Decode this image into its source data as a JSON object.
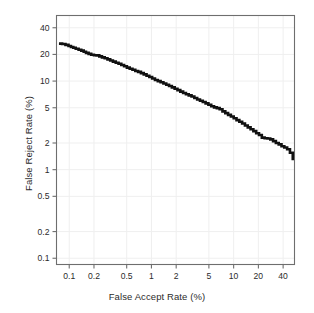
{
  "figure": {
    "background_color": "#ffffff",
    "frame_color": "#6e6e6e",
    "grid_color": "#efefef",
    "curve_color": "#111111",
    "text_color": "#2b2b2b"
  },
  "chart_data": {
    "type": "line",
    "title": "",
    "subtitle": "",
    "xlabel": "False Accept Rate (%)",
    "ylabel": "False Reject Rate (%)",
    "xscale": "log",
    "yscale": "log",
    "xlim": [
      0.07,
      55
    ],
    "ylim": [
      0.085,
      55
    ],
    "grid": true,
    "legend": null,
    "xticks": [
      0.1,
      0.2,
      0.5,
      1,
      2,
      5,
      10,
      20,
      40
    ],
    "xticklabels": [
      "0.1",
      "0.2",
      "0.5",
      "1",
      "2",
      "5",
      "10",
      "20",
      "40"
    ],
    "yticks": [
      0.1,
      0.2,
      0.5,
      1,
      2,
      5,
      10,
      20,
      40
    ],
    "yticklabels": [
      "0.1",
      "0.2",
      "0.5",
      "1",
      "2",
      "5",
      "10",
      "20",
      "40"
    ],
    "series": [
      {
        "name": "DET curve",
        "color": "#111111",
        "linewidth": 2.6,
        "x": [
          0.075,
          0.082,
          0.09,
          0.098,
          0.105,
          0.112,
          0.12,
          0.13,
          0.14,
          0.15,
          0.16,
          0.172,
          0.185,
          0.2,
          0.215,
          0.232,
          0.25,
          0.27,
          0.292,
          0.315,
          0.34,
          0.368,
          0.398,
          0.43,
          0.465,
          0.503,
          0.544,
          0.588,
          0.636,
          0.688,
          0.745,
          0.806,
          0.872,
          0.943,
          1.02,
          1.104,
          1.195,
          1.293,
          1.399,
          1.514,
          1.638,
          1.772,
          1.917,
          2.074,
          2.244,
          2.428,
          2.627,
          2.842,
          3.075,
          3.327,
          3.6,
          3.895,
          4.214,
          4.559,
          4.933,
          5.337,
          5.774,
          6.247,
          6.759,
          7.313,
          7.912,
          8.56,
          9.262,
          10.02,
          10.84,
          11.73,
          12.69,
          13.73,
          14.85,
          16.07,
          17.38,
          18.81,
          20.35,
          22.02,
          23.82,
          25.78,
          27.89,
          30.18,
          32.65,
          35.33,
          38.22,
          41.36,
          44.75,
          48.42,
          52.39
        ],
        "y": [
          26.5,
          26.2,
          25.6,
          24.9,
          24.3,
          23.8,
          23.2,
          22.6,
          22.1,
          21.4,
          20.8,
          20.3,
          19.8,
          19.6,
          19.5,
          19.0,
          18.5,
          18.1,
          17.6,
          17.1,
          16.6,
          16.1,
          15.7,
          15.2,
          14.7,
          14.2,
          13.8,
          13.4,
          13.0,
          12.7,
          12.3,
          11.9,
          11.5,
          11.1,
          10.7,
          10.3,
          10.0,
          9.7,
          9.4,
          9.1,
          8.8,
          8.5,
          8.2,
          7.9,
          7.6,
          7.35,
          7.1,
          6.9,
          6.7,
          6.45,
          6.2,
          6.0,
          5.8,
          5.6,
          5.4,
          5.2,
          5.05,
          4.95,
          4.8,
          4.55,
          4.35,
          4.15,
          3.98,
          3.8,
          3.62,
          3.48,
          3.32,
          3.15,
          3.0,
          2.86,
          2.72,
          2.58,
          2.46,
          2.3,
          2.26,
          2.25,
          2.2,
          2.1,
          2.0,
          1.93,
          1.84,
          1.78,
          1.7,
          1.55,
          1.28
        ]
      }
    ]
  }
}
